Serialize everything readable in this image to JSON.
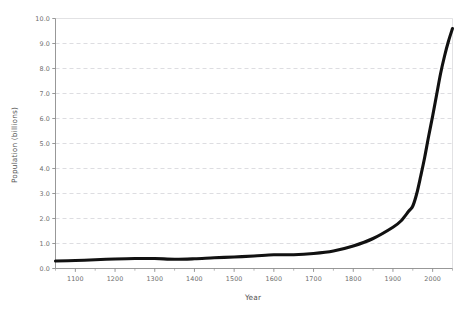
{
  "chart_data": {
    "type": "line",
    "title": "",
    "subtitle": "",
    "xlabel": "Year",
    "ylabel": "Population (billions)",
    "xlim": [
      1050,
      2050
    ],
    "ylim": [
      0.0,
      10.0
    ],
    "grid": true,
    "legend": false,
    "legend_position": "none",
    "x_ticks": [
      1100,
      1200,
      1300,
      1400,
      1500,
      1600,
      1700,
      1800,
      1900,
      2000
    ],
    "x_tick_labels": [
      "1100",
      "1200",
      "1300",
      "1400",
      "1500",
      "1600",
      "1700",
      "1800",
      "1900",
      "2000"
    ],
    "x_minor_tick_interval": 50,
    "y_ticks": [
      0.0,
      1.0,
      2.0,
      3.0,
      4.0,
      5.0,
      6.0,
      7.0,
      8.0,
      9.0,
      10.0
    ],
    "y_tick_labels": [
      "0.0",
      "1.0",
      "2.0",
      "3.0",
      "4.0",
      "5.0",
      "6.0",
      "7.0",
      "8.0",
      "9.0",
      "10.0"
    ],
    "series": [
      {
        "name": "World population",
        "color": "#111111",
        "line_width": 3.1,
        "x": [
          1050,
          1100,
          1150,
          1200,
          1250,
          1300,
          1350,
          1400,
          1450,
          1500,
          1550,
          1600,
          1650,
          1700,
          1750,
          1800,
          1850,
          1900,
          1920,
          1940,
          1950,
          1960,
          1970,
          1980,
          1990,
          2000,
          2010,
          2020,
          2030,
          2040,
          2050
        ],
        "y": [
          0.3,
          0.32,
          0.35,
          0.38,
          0.4,
          0.4,
          0.37,
          0.39,
          0.43,
          0.46,
          0.5,
          0.55,
          0.55,
          0.6,
          0.7,
          0.9,
          1.2,
          1.65,
          1.9,
          2.3,
          2.5,
          3.0,
          3.7,
          4.45,
          5.3,
          6.1,
          6.95,
          7.8,
          8.5,
          9.1,
          9.6
        ]
      }
    ]
  },
  "axes": {
    "y_axis_title": "Population (billions)",
    "x_axis_title": "Year"
  },
  "colors": {
    "background": "#ffffff",
    "curve": "#111111",
    "gridline": "#cfcfd4",
    "axis": "#8c8c8c",
    "tick_text": "#6e6e6e",
    "axis_title_text": "#555555"
  }
}
